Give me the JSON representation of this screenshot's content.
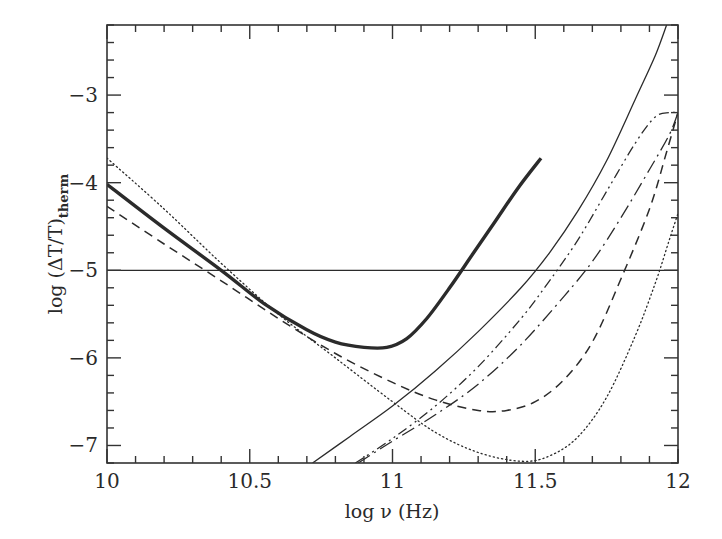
{
  "chart_data": {
    "type": "line",
    "title": "",
    "xlabel": "log ν (Hz)",
    "ylabel": "log (ΔT/T)",
    "ylabel_subscript": "therm",
    "xlim": [
      10,
      12
    ],
    "ylim": [
      -7.2,
      -2.2
    ],
    "grid": false,
    "legend": "none",
    "x_ticks": [
      10,
      10.5,
      11,
      11.5,
      12
    ],
    "x_tick_labels": [
      "10",
      "10.5",
      "11",
      "11.5",
      "12"
    ],
    "y_ticks": [
      -3,
      -4,
      -5,
      -6,
      -7
    ],
    "y_tick_labels": [
      "-3",
      "-4",
      "-5",
      "-6",
      "-7"
    ],
    "series": [
      {
        "name": "thick-solid",
        "style": "solid",
        "width": 3.4,
        "x": [
          10.0,
          10.2,
          10.4,
          10.55,
          10.7,
          10.8,
          10.9,
          10.98,
          11.05,
          11.12,
          11.2,
          11.28,
          11.36,
          11.44,
          11.52
        ],
        "y": [
          -4.02,
          -4.52,
          -5.0,
          -5.38,
          -5.68,
          -5.82,
          -5.88,
          -5.88,
          -5.78,
          -5.55,
          -5.2,
          -4.82,
          -4.44,
          -4.06,
          -3.72
        ]
      },
      {
        "name": "dotted",
        "style": "dotted",
        "width": 1.3,
        "x": [
          10.0,
          10.2,
          10.4,
          10.6,
          10.8,
          11.0,
          11.15,
          11.3,
          11.45,
          11.55,
          11.65,
          11.75,
          11.85,
          11.92,
          11.97,
          12.0
        ],
        "y": [
          -3.72,
          -4.3,
          -4.92,
          -5.5,
          -6.0,
          -6.5,
          -6.85,
          -7.08,
          -7.18,
          -7.12,
          -6.9,
          -6.45,
          -5.75,
          -5.15,
          -4.65,
          -4.35
        ]
      },
      {
        "name": "dashed",
        "style": "dashed",
        "width": 1.5,
        "x": [
          10.0,
          10.2,
          10.4,
          10.6,
          10.8,
          11.0,
          11.15,
          11.3,
          11.4,
          11.5,
          11.6,
          11.7,
          11.8,
          11.9,
          11.96,
          12.0
        ],
        "y": [
          -4.27,
          -4.7,
          -5.12,
          -5.55,
          -5.95,
          -6.28,
          -6.48,
          -6.6,
          -6.6,
          -6.5,
          -6.25,
          -5.82,
          -5.1,
          -4.3,
          -3.65,
          -3.2
        ]
      },
      {
        "name": "thin-solid",
        "style": "solid",
        "width": 1.3,
        "x": [
          10.72,
          10.85,
          11.0,
          11.15,
          11.3,
          11.45,
          11.55,
          11.65,
          11.75,
          11.85,
          11.92,
          11.96
        ],
        "y": [
          -7.2,
          -6.9,
          -6.55,
          -6.15,
          -5.7,
          -5.2,
          -4.8,
          -4.32,
          -3.75,
          -3.05,
          -2.55,
          -2.2
        ]
      },
      {
        "name": "dash-dot-dot",
        "style": "dashdotdot",
        "width": 1.3,
        "x": [
          10.87,
          11.0,
          11.15,
          11.3,
          11.45,
          11.55,
          11.65,
          11.75,
          11.85,
          11.92,
          11.97,
          12.0
        ],
        "y": [
          -7.2,
          -6.92,
          -6.55,
          -6.1,
          -5.55,
          -5.12,
          -4.65,
          -4.1,
          -3.55,
          -3.25,
          -3.2,
          -3.2
        ]
      },
      {
        "name": "long-dash-dot",
        "style": "dashdot",
        "width": 1.3,
        "x": [
          10.88,
          11.0,
          11.15,
          11.3,
          11.45,
          11.6,
          11.7,
          11.8,
          11.9,
          11.97,
          12.0
        ],
        "y": [
          -7.2,
          -6.95,
          -6.65,
          -6.3,
          -5.85,
          -5.3,
          -4.9,
          -4.4,
          -3.85,
          -3.45,
          -3.2
        ]
      },
      {
        "name": "horizontal-reference",
        "style": "solid",
        "width": 1.3,
        "x": [
          10.0,
          12.0
        ],
        "y": [
          -5.0,
          -5.0
        ]
      }
    ]
  }
}
